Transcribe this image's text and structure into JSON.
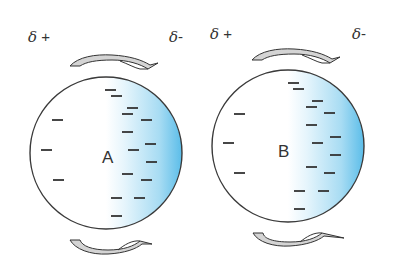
{
  "diagram": {
    "type": "induced-dipole-interaction",
    "colors": {
      "outline": "#3a3a3a",
      "electron_cloud": "#5bbde9",
      "dash": "#333333",
      "arrow_fill": "#d4d4d4",
      "arrow_stroke": "#333333"
    },
    "charge_labels": {
      "left_a": {
        "symbol": "δ",
        "sign": "+"
      },
      "right_a": {
        "symbol": "δ",
        "sign": "-"
      },
      "left_b": {
        "symbol": "δ",
        "sign": "+"
      },
      "right_b": {
        "symbol": "δ",
        "sign": "-"
      }
    },
    "molecules": [
      {
        "label": "A",
        "cx": 106,
        "cy": 153,
        "r": 76,
        "left_charges": 3,
        "right_charges": 16
      },
      {
        "label": "B",
        "cx": 288,
        "cy": 146,
        "r": 76,
        "left_charges": 3,
        "right_charges": 16
      }
    ],
    "arrows": [
      {
        "position": "top-left",
        "direction": "clockwise"
      },
      {
        "position": "top-right",
        "direction": "clockwise"
      },
      {
        "position": "bottom-left",
        "direction": "counter-clockwise"
      },
      {
        "position": "bottom-right",
        "direction": "counter-clockwise"
      }
    ]
  }
}
